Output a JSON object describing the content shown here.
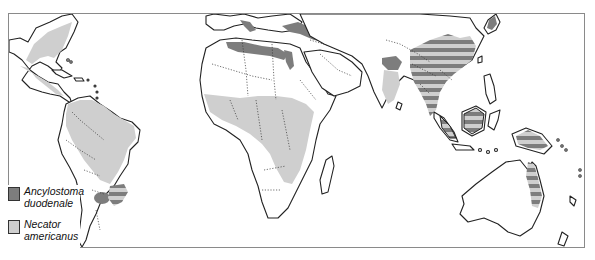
{
  "map": {
    "subject": "Geographic distribution of hookworm species",
    "colors": {
      "ancylostoma_duodenale": "#7d7d7d",
      "necator_americanus": "#cfcfcf",
      "overlap_pattern": "striped (#7d7d7d / #cfcfcf)",
      "land": "#ffffff",
      "coastline": "#222222"
    },
    "regions_ancylostoma": [
      "Mediterranean coast",
      "North Africa coast",
      "Nile delta",
      "Turkey / Caspian region",
      "Northern India",
      "Northern Argentina / Paraguay"
    ],
    "regions_necator": [
      "Southeastern USA",
      "Central America",
      "Northern South America / Brazil",
      "Sub-Saharan Africa",
      "Southern India"
    ],
    "regions_both": [
      "China",
      "Southeast Asia",
      "Indonesia",
      "Philippines",
      "New Guinea",
      "Northeastern Australia",
      "Southern Brazil"
    ]
  },
  "legend": {
    "items": [
      {
        "label_line1": "Ancylostoma",
        "label_line2": "duodenale",
        "color": "#7d7d7d"
      },
      {
        "label_line1": "Necator",
        "label_line2": "americanus",
        "color": "#cfcfcf"
      }
    ]
  }
}
